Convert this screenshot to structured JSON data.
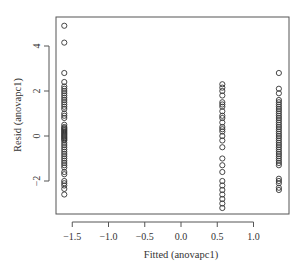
{
  "chart_data": {
    "type": "scatter",
    "title": "",
    "xlabel": "Fitted (anovapc1)",
    "ylabel": "Resid (anovapc1)",
    "xlim": [
      -1.75,
      1.5
    ],
    "ylim": [
      -3.5,
      5.25
    ],
    "x_ticks": [
      -1.5,
      -1.0,
      -0.5,
      0.0,
      0.5,
      1.0
    ],
    "x_tick_labels": [
      "−1.5",
      "−1.0",
      "−0.5",
      "0.0",
      "0.5",
      "1.0"
    ],
    "y_ticks": [
      -2,
      0,
      2,
      4
    ],
    "y_tick_labels": [
      "−2",
      "0",
      "2",
      "4"
    ],
    "grid": false,
    "legend": null,
    "marker": "open-circle",
    "series": [
      {
        "name": "group-1",
        "x": -1.61,
        "y": [
          4.9,
          4.15,
          2.8,
          2.4,
          2.2,
          2.1,
          2.0,
          1.9,
          1.8,
          1.7,
          1.6,
          1.5,
          1.4,
          1.3,
          1.2,
          1.0,
          0.9,
          0.8,
          0.5,
          0.4,
          0.35,
          0.3,
          0.25,
          0.2,
          0.15,
          0.1,
          0.05,
          0.0,
          -0.05,
          -0.1,
          -0.15,
          -0.2,
          -0.3,
          -0.4,
          -0.5,
          -0.6,
          -0.7,
          -0.8,
          -0.9,
          -1.0,
          -1.1,
          -1.2,
          -1.3,
          -1.4,
          -1.6,
          -1.7,
          -2.0,
          -2.1,
          -2.2,
          -2.35,
          -2.6
        ]
      },
      {
        "name": "group-2",
        "x": 0.57,
        "y": [
          2.3,
          2.15,
          2.0,
          1.8,
          1.5,
          1.4,
          1.3,
          1.1,
          0.9,
          0.8,
          0.6,
          0.4,
          0.3,
          0.2,
          0.0,
          -0.2,
          -0.5,
          -1.0,
          -1.3,
          -1.6,
          -2.0,
          -2.2,
          -2.4,
          -2.6,
          -2.8,
          -3.0,
          -3.2
        ]
      },
      {
        "name": "group-3",
        "x": 1.35,
        "y": [
          2.8,
          2.1,
          1.9,
          1.6,
          1.5,
          1.4,
          1.3,
          1.2,
          1.1,
          1.0,
          0.9,
          0.8,
          0.7,
          0.6,
          0.5,
          0.4,
          0.3,
          0.2,
          0.1,
          0.0,
          -0.1,
          -0.2,
          -0.3,
          -0.4,
          -0.5,
          -0.6,
          -0.7,
          -0.8,
          -0.9,
          -1.0,
          -1.1,
          -1.2,
          -1.3,
          -1.9,
          -2.0,
          -2.1,
          -2.3,
          -2.4
        ]
      }
    ]
  },
  "style": {
    "point_color": "#333333",
    "axis_color": "#555555",
    "background": "#ffffff"
  }
}
